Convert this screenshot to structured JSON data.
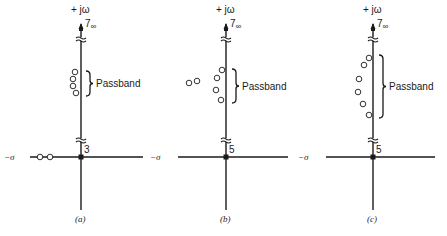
{
  "figure": {
    "panels": [
      {
        "id": "a",
        "caption": "(a)",
        "axis_x": 81,
        "axis_y": 157,
        "h_left": 30,
        "h_right": 143,
        "v_top": 24,
        "v_bottom": 210,
        "jw_label": "+ jω",
        "sigma_label": "−σ",
        "infinity_label": "7∞",
        "origin_order": "3",
        "passband_label": "Passband",
        "zeros": [
          {
            "x": 75,
            "y": 72
          },
          {
            "x": 73,
            "y": 79
          },
          {
            "x": 73,
            "y": 86
          },
          {
            "x": 76,
            "y": 93
          },
          {
            "x": 40,
            "y": 157
          },
          {
            "x": 50,
            "y": 157
          }
        ],
        "brace": {
          "x": 86,
          "y1": 71,
          "y2": 96
        }
      },
      {
        "id": "b",
        "caption": "(b)",
        "axis_x": 226,
        "axis_y": 157,
        "h_left": 178,
        "h_right": 288,
        "v_top": 24,
        "v_bottom": 210,
        "jw_label": "+ jω",
        "sigma_label": "−σ",
        "infinity_label": "7∞",
        "origin_order": "5",
        "passband_label": "Passband",
        "zeros": [
          {
            "x": 222,
            "y": 70
          },
          {
            "x": 217,
            "y": 78
          },
          {
            "x": 216,
            "y": 90
          },
          {
            "x": 221,
            "y": 100
          },
          {
            "x": 189,
            "y": 83
          },
          {
            "x": 197,
            "y": 81
          }
        ],
        "brace": {
          "x": 232,
          "y1": 69,
          "y2": 103
        }
      },
      {
        "id": "c",
        "caption": "(c)",
        "axis_x": 373,
        "axis_y": 157,
        "h_left": 326,
        "h_right": 435,
        "v_top": 24,
        "v_bottom": 210,
        "jw_label": "+ jω",
        "sigma_label": "−σ",
        "infinity_label": "7∞",
        "origin_order": "5",
        "passband_label": "Passband",
        "zeros": [
          {
            "x": 369,
            "y": 58
          },
          {
            "x": 364,
            "y": 65
          },
          {
            "x": 359,
            "y": 79
          },
          {
            "x": 358,
            "y": 92
          },
          {
            "x": 363,
            "y": 104
          },
          {
            "x": 369,
            "y": 115
          }
        ],
        "brace": {
          "x": 379,
          "y1": 55,
          "y2": 118
        }
      }
    ]
  }
}
